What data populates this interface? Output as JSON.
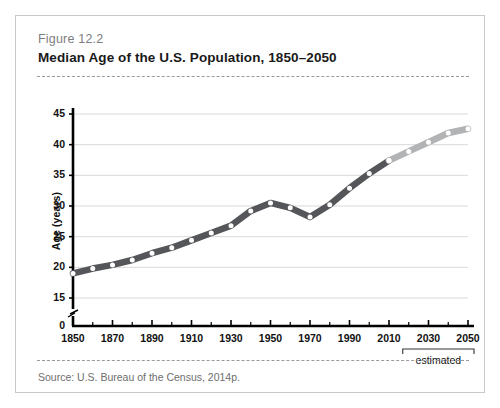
{
  "figure": {
    "label": "Figure 12.2",
    "title": "Median Age of the U.S. Population, 1850–2050",
    "source": "Source: U.S. Bureau of the Census, 2014p."
  },
  "annotations": {
    "estimated_bracket_label": "estimated"
  },
  "colors": {
    "line_actual": "#55565a",
    "line_estimated": "#b2b3b5",
    "marker_fill": "#ffffff",
    "axis": "#000000",
    "gridline": "#d9d9d9",
    "frame": "#c8c8c8",
    "figure_label": "#7d7d7d",
    "title": "#1a1a1a",
    "source": "#6e6e6e"
  },
  "chart_data": {
    "type": "line",
    "title": "Median Age of the U.S. Population, 1850–2050",
    "xlabel": "",
    "ylabel": "Age (years)",
    "xlim": [
      1850,
      2050
    ],
    "ylim": [
      15,
      45
    ],
    "y_axis_break": true,
    "y_axis_break_between": [
      0,
      15
    ],
    "grid": true,
    "legend": false,
    "ytick_labels": [
      "0",
      "15",
      "20",
      "25",
      "30",
      "35",
      "40",
      "45"
    ],
    "yticks": [
      0,
      15,
      20,
      25,
      30,
      35,
      40,
      45
    ],
    "xtick_labels": [
      "1850",
      "1870",
      "1890",
      "1910",
      "1930",
      "1950",
      "1970",
      "1990",
      "2010",
      "2030",
      "2050"
    ],
    "xticks": [
      1850,
      1870,
      1890,
      1910,
      1930,
      1950,
      1970,
      1990,
      2010,
      2030,
      2050
    ],
    "x_minor_interval": 10,
    "x": [
      1850,
      1860,
      1870,
      1880,
      1890,
      1900,
      1910,
      1920,
      1930,
      1940,
      1950,
      1960,
      1970,
      1980,
      1990,
      2000,
      2010,
      2020,
      2030,
      2040,
      2050
    ],
    "series": [
      {
        "name": "Median age (actual)",
        "style": "solid-dark",
        "x": [
          1850,
          1860,
          1870,
          1880,
          1890,
          1900,
          1910,
          1920,
          1930,
          1940,
          1950,
          1960,
          1970,
          1980,
          1990,
          2000,
          2010
        ],
        "values": [
          19.0,
          19.8,
          20.4,
          21.2,
          22.3,
          23.2,
          24.4,
          25.6,
          26.8,
          29.2,
          30.5,
          29.7,
          28.2,
          30.2,
          32.9,
          35.3,
          37.4
        ]
      },
      {
        "name": "Median age (estimated)",
        "style": "solid-light",
        "x": [
          2010,
          2020,
          2030,
          2040,
          2050
        ],
        "values": [
          37.4,
          38.9,
          40.4,
          41.9,
          42.6
        ]
      }
    ],
    "estimated_range": [
      2020,
      2050
    ]
  }
}
